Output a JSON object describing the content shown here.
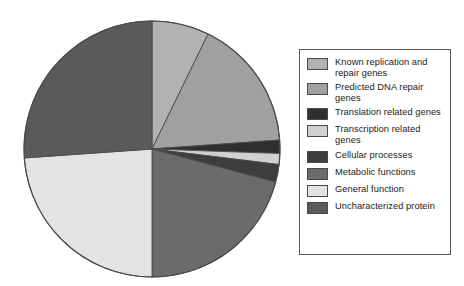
{
  "chart_data": {
    "type": "pie",
    "title": "",
    "subtitle": "",
    "legend_position": "right",
    "grid": false,
    "start_angle_deg": 0,
    "direction": "clockwise",
    "categories": [
      "Known replication and repair genes",
      "Predicted DNA repair genes",
      "Translation related genes",
      "Transcription related genes",
      "Cellular processes",
      "Metabolic functions",
      "General function",
      "Uncharacterized protein"
    ],
    "values": [
      7.2,
      16.7,
      1.7,
      1.4,
      2.2,
      20.8,
      23.9,
      26.1
    ],
    "value_unit": "percent",
    "angles_deg": [
      26,
      60,
      6,
      5,
      8,
      75,
      86,
      94
    ],
    "colors": [
      "#b2b2b2",
      "#a0a0a0",
      "#2f2f2f",
      "#d0d0d0",
      "#3d3d3d",
      "#6b6b6b",
      "#e3e3e3",
      "#5a5a5a"
    ],
    "slice_border_color": "#4a4a4a",
    "pie": {
      "center_x": 130,
      "center_y": 130,
      "radius": 128
    }
  },
  "legend": {
    "border_color": "#5a5a5a",
    "items": [
      {
        "label": "Known replication and repair genes",
        "color": "#b2b2b2"
      },
      {
        "label": "Predicted DNA repair genes",
        "color": "#a0a0a0"
      },
      {
        "label": "Translation related genes",
        "color": "#2f2f2f"
      },
      {
        "label": "Transcription related genes",
        "color": "#d0d0d0"
      },
      {
        "label": "Cellular processes",
        "color": "#3d3d3d"
      },
      {
        "label": "Metabolic functions",
        "color": "#6b6b6b"
      },
      {
        "label": "General function",
        "color": "#e3e3e3"
      },
      {
        "label": "Uncharacterized protein",
        "color": "#5a5a5a"
      }
    ]
  }
}
